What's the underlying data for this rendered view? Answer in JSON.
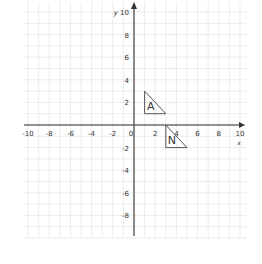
{
  "diagram": {
    "type": "coordinate-grid",
    "x_axis": {
      "label": "x",
      "min": -10,
      "max": 10,
      "tick_labels": [
        "-10",
        "-8",
        "-6",
        "-4",
        "-2",
        "0",
        "2",
        "4",
        "6",
        "8",
        "10"
      ]
    },
    "y_axis": {
      "label": "y",
      "min": -10,
      "max": 10,
      "tick_labels": [
        "10",
        "8",
        "6",
        "4",
        "2",
        "-2",
        "-4",
        "-6",
        "-8"
      ]
    },
    "grid_step": 1,
    "shapes": [
      {
        "label": "A",
        "vertices": [
          [
            1,
            3
          ],
          [
            1,
            1
          ],
          [
            3,
            1
          ]
        ]
      },
      {
        "label": "N",
        "vertices": [
          [
            3,
            0
          ],
          [
            3,
            -2
          ],
          [
            5,
            -2
          ]
        ]
      }
    ],
    "colors": {
      "grid": "#e6e6e6",
      "axis": "#333333",
      "shape": "#555555"
    }
  }
}
